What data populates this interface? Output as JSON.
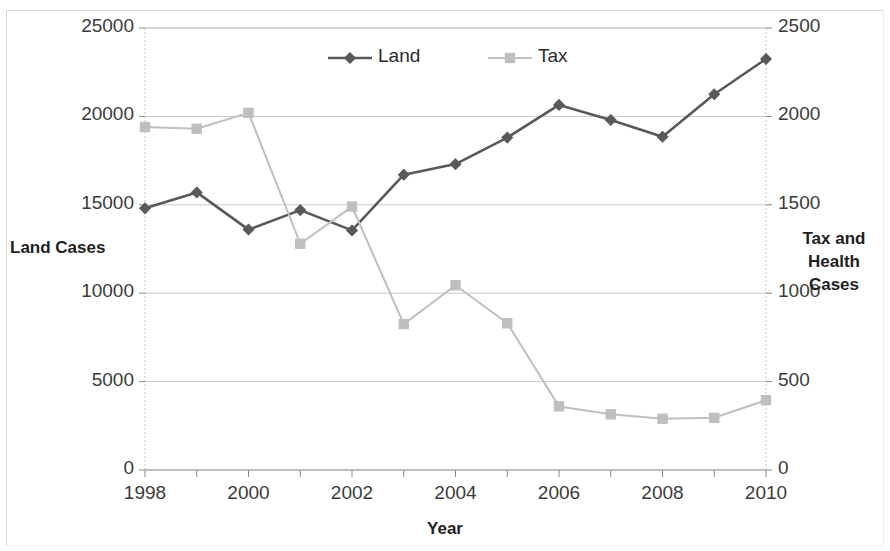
{
  "chart_data": {
    "type": "line",
    "title": "",
    "xlabel": "Year",
    "ylabel": "Land Cases",
    "y2label": "Tax  and Health Cases",
    "grid": true,
    "legend_position": "top-center",
    "x": [
      1998,
      1999,
      2000,
      2001,
      2002,
      2003,
      2004,
      2005,
      2006,
      2007,
      2008,
      2009,
      2010
    ],
    "xtick_labels": [
      "1998",
      "2000",
      "2002",
      "2004",
      "2006",
      "2008",
      "2010"
    ],
    "xtick_values": [
      1998,
      2000,
      2002,
      2004,
      2006,
      2008,
      2010
    ],
    "xlim": [
      1998,
      2010
    ],
    "ylim": [
      0,
      25000
    ],
    "ytick_labels": [
      "0",
      "5000",
      "10000",
      "15000",
      "20000",
      "25000"
    ],
    "ytick_values": [
      0,
      5000,
      10000,
      15000,
      20000,
      25000
    ],
    "y2lim": [
      0,
      2500
    ],
    "y2tick_labels": [
      "0",
      "500",
      "1000",
      "1500",
      "2000",
      "2500"
    ],
    "y2tick_values": [
      0,
      500,
      1000,
      1500,
      2000,
      2500
    ],
    "series": [
      {
        "name": "Land",
        "axis": "left",
        "color": "#595959",
        "marker": "diamond",
        "values": [
          14800,
          15700,
          13600,
          14700,
          13550,
          16700,
          17300,
          18800,
          20650,
          19800,
          18850,
          21250,
          23250
        ]
      },
      {
        "name": "Tax",
        "axis": "right",
        "color": "#bfbfbf",
        "marker": "square",
        "values": [
          1940,
          1930,
          2020,
          1280,
          1490,
          825,
          1045,
          830,
          360,
          315,
          290,
          295,
          395
        ]
      }
    ]
  },
  "legend": {
    "items": [
      {
        "label": "Land",
        "color": "#595959",
        "marker": "diamond"
      },
      {
        "label": "Tax",
        "color": "#bfbfbf",
        "marker": "square"
      }
    ]
  },
  "axes": {
    "left_title": "Land Cases",
    "right_title_line1": "Tax  and",
    "right_title_line2": "Health Cases",
    "x_title": "Year"
  }
}
